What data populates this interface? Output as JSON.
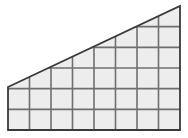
{
  "figure": {
    "name": "gridded-right-trapezoid",
    "canvas": {
      "width": 188,
      "height": 138
    },
    "colors": {
      "cell_fill": "#ededed",
      "grid_line": "#6f6f6f",
      "outline": "#3a3a3a",
      "background": "#ffffff"
    },
    "stroke_widths": {
      "grid": 1.6,
      "outline": 1.8
    },
    "geometry": {
      "left_x": 8,
      "right_x": 180,
      "bottom_y": 130,
      "apex_y": 6,
      "left_top_y": 87,
      "columns": 8,
      "max_rows": 6,
      "cell_width": 21.5,
      "cell_height": 20.666,
      "x_gridlines": [
        8,
        29.5,
        51,
        72.5,
        94,
        115.5,
        137,
        158.5,
        180
      ],
      "y_gridlines": [
        6,
        26.667,
        47.333,
        68,
        88.667,
        109.333,
        130
      ]
    },
    "hypotenuse": {
      "from": [
        8,
        87
      ],
      "to": [
        180,
        6
      ]
    },
    "column_top_y": [
      87,
      78.9,
      70.8,
      62.7,
      54.6,
      46.5,
      38.4,
      30.3,
      6
    ],
    "chart_data": {
      "type": "table",
      "title": "",
      "categories": [
        "c1",
        "c2",
        "c3",
        "c4",
        "c5",
        "c6",
        "c7",
        "c8"
      ],
      "values": [
        4,
        4,
        5,
        5,
        5,
        6,
        6,
        6
      ],
      "xlabel": "",
      "ylabel": ""
    }
  }
}
